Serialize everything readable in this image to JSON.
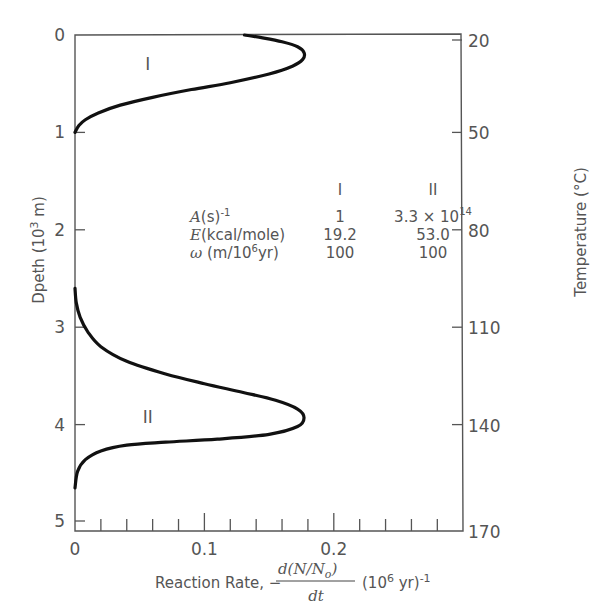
{
  "chart_data": {
    "type": "line",
    "title": "",
    "xlabel": "Reaction Rate, − d(N/No)/dt (10^6 yr)^-1",
    "xlabel_parts": {
      "prefix": "Reaction Rate, −",
      "numerator": "d(N/N",
      "numerator_sub": "o",
      "numerator_close": ")",
      "denominator": "dt",
      "units_pre": "(10",
      "units_sup": "6",
      "units_mid": " yr)",
      "units_sup2": "-1"
    },
    "ylabel": "Dpeth (10³ m)",
    "ylabel_parts": {
      "text": "Dpeth (10",
      "sup": "3",
      "tail": " m)"
    },
    "y2label": "Temperature (°C)",
    "xlim": [
      0,
      0.3
    ],
    "ylim": [
      5.1,
      0
    ],
    "x_ticks": [
      0,
      0.1,
      0.2
    ],
    "x_tick_labels": [
      "0",
      "0.1",
      "0.2"
    ],
    "x_minor_step": 0.02,
    "y_ticks": [
      0,
      1,
      2,
      3,
      4,
      5
    ],
    "y_tick_labels": [
      "0",
      "1",
      "2",
      "3",
      "4",
      "5"
    ],
    "y2_ticks_depth": [
      0.1,
      1.0,
      2.0,
      3.0,
      4.0,
      5.0
    ],
    "y2_tick_labels": [
      "20",
      "50",
      "80",
      "110",
      "140",
      "170"
    ],
    "grid": false,
    "series": [
      {
        "name": "I",
        "label_pos": {
          "x": 0.05,
          "depth": 0.3
        },
        "points": [
          [
            0.131,
            0.0
          ],
          [
            0.145,
            0.03
          ],
          [
            0.16,
            0.07
          ],
          [
            0.172,
            0.12
          ],
          [
            0.177,
            0.18
          ],
          [
            0.176,
            0.25
          ],
          [
            0.168,
            0.32
          ],
          [
            0.15,
            0.4
          ],
          [
            0.12,
            0.49
          ],
          [
            0.09,
            0.56
          ],
          [
            0.06,
            0.64
          ],
          [
            0.035,
            0.72
          ],
          [
            0.018,
            0.8
          ],
          [
            0.008,
            0.87
          ],
          [
            0.003,
            0.93
          ],
          [
            0.0,
            1.0
          ]
        ]
      },
      {
        "name": "II",
        "label_pos": {
          "x": 0.05,
          "depth": 3.92
        },
        "points": [
          [
            0.0,
            2.6
          ],
          [
            0.001,
            2.75
          ],
          [
            0.004,
            2.9
          ],
          [
            0.01,
            3.05
          ],
          [
            0.02,
            3.2
          ],
          [
            0.04,
            3.35
          ],
          [
            0.07,
            3.48
          ],
          [
            0.1,
            3.58
          ],
          [
            0.13,
            3.67
          ],
          [
            0.155,
            3.75
          ],
          [
            0.172,
            3.84
          ],
          [
            0.177,
            3.93
          ],
          [
            0.172,
            4.02
          ],
          [
            0.15,
            4.1
          ],
          [
            0.11,
            4.15
          ],
          [
            0.07,
            4.18
          ],
          [
            0.04,
            4.21
          ],
          [
            0.02,
            4.27
          ],
          [
            0.008,
            4.36
          ],
          [
            0.002,
            4.48
          ],
          [
            0.0,
            4.65
          ]
        ]
      }
    ],
    "annotations": {
      "table": {
        "headers": [
          "",
          "I",
          "II"
        ],
        "rows": [
          {
            "param": "A",
            "param_tail": "(s)",
            "param_sup": "-1",
            "I": "1",
            "II": "3.3 × 10",
            "II_sup": "14"
          },
          {
            "param": "E",
            "param_tail": "(kcal/mole)",
            "param_sup": "",
            "I": "19.2",
            "II": "53.0",
            "II_sup": ""
          },
          {
            "param": "ω",
            "param_tail": " (m/10",
            "param_sup": "6",
            "param_tail2": "yr)",
            "I": "100",
            "II": "100",
            "II_sup": ""
          }
        ]
      }
    }
  }
}
